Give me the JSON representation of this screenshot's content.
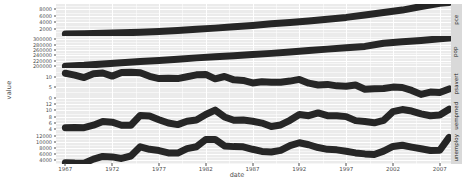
{
  "chart_data": {
    "type": "line",
    "title": "",
    "subtitle": "",
    "xlabel": "date",
    "ylabel": "value",
    "grid": true,
    "legend": "none",
    "facet": {
      "type": "wrap-vertical",
      "strip_position": "right",
      "scales": "free_y",
      "labels": [
        "pce",
        "pop",
        "psavert",
        "uempmed",
        "unemploy"
      ]
    },
    "x": {
      "label": "date",
      "ticks": [
        "1967",
        "1972",
        "1977",
        "1982",
        "1987",
        "1992",
        "1997",
        "2002",
        "2007"
      ],
      "values": [
        1967,
        1972,
        1977,
        1982,
        1987,
        1992,
        1997,
        2002,
        2007
      ],
      "range": [
        1966.0,
        2008.2
      ],
      "minor_ticks": [
        1969.5,
        1974.5,
        1979.5,
        1984.5,
        1989.5,
        1994.5,
        1999.5,
        2004.5
      ]
    },
    "panels": [
      {
        "name": "pce",
        "strip_label": "pce",
        "ylabel_ticks": [
          "8000",
          "6000",
          "4000",
          "2000"
        ],
        "ytick_values": [
          8000,
          6000,
          4000,
          2000
        ],
        "ylim": [
          -100,
          9600
        ],
        "series": {
          "name": "pce",
          "x": [
            1967,
            1969,
            1971,
            1973,
            1975,
            1977,
            1979,
            1981,
            1983,
            1985,
            1987,
            1989,
            1991,
            1993,
            1995,
            1997,
            1999,
            2001,
            2003,
            2005,
            2007,
            2008
          ],
          "y": [
            507,
            603,
            703,
            859,
            1035,
            1278,
            1588,
            1937,
            2286,
            2705,
            3101,
            3596,
            3972,
            4454,
            4976,
            5540,
            6261,
            7047,
            7760,
            8819,
            9827,
            10058
          ]
        }
      },
      {
        "name": "pop",
        "strip_label": "pop",
        "ylabel_ticks": [
          "300000",
          "280000",
          "260000",
          "240000",
          "220000",
          "200000"
        ],
        "ytick_values": [
          300000,
          280000,
          260000,
          240000,
          220000,
          200000
        ],
        "ylim": [
          192000,
          312000
        ],
        "series": {
          "name": "pop",
          "x": [
            1967,
            1969,
            1971,
            1973,
            1975,
            1977,
            1979,
            1981,
            1983,
            1985,
            1987,
            1989,
            1991,
            1993,
            1995,
            1997,
            1999,
            2001,
            2003,
            2005,
            2007,
            2008
          ],
          "y": [
            198712,
            201898,
            206827,
            211357,
            215973,
            220239,
            225055,
            229966,
            233792,
            237924,
            242289,
            246819,
            252153,
            257783,
            262803,
            267784,
            272958,
            284968,
            290108,
            295516,
            301231,
            304000
          ]
        }
      },
      {
        "name": "psavert",
        "strip_label": "psavert",
        "ylabel_ticks": [
          "10",
          "5",
          "0"
        ],
        "ytick_values": [
          10,
          5,
          0
        ],
        "ylim": [
          -1.2,
          14.2
        ],
        "series": {
          "name": "psavert",
          "x": [
            1967,
            1968,
            1969,
            1970,
            1971,
            1972,
            1973,
            1974,
            1975,
            1976,
            1977,
            1978,
            1979,
            1980,
            1981,
            1982,
            1983,
            1984,
            1985,
            1986,
            1987,
            1988,
            1989,
            1990,
            1991,
            1992,
            1993,
            1994,
            1995,
            1996,
            1997,
            1998,
            1999,
            2000,
            2001,
            2002,
            2003,
            2004,
            2005,
            2006,
            2007,
            2008
          ],
          "y": [
            11.7,
            10.8,
            9.6,
            11.4,
            11.8,
            10.3,
            12.0,
            12.2,
            11.9,
            10.2,
            9.1,
            9.3,
            9.1,
            10.0,
            10.9,
            11.1,
            9.0,
            10.1,
            8.5,
            8.2,
            7.0,
            7.6,
            7.4,
            7.3,
            7.9,
            8.7,
            6.9,
            6.0,
            6.3,
            5.6,
            5.4,
            6.0,
            4.0,
            4.2,
            4.3,
            5.0,
            4.8,
            3.4,
            1.5,
            2.6,
            2.4,
            4.1
          ]
        }
      },
      {
        "name": "uempmed",
        "strip_label": "uempmed",
        "ylabel_ticks": [
          "12",
          "10",
          "8",
          "6",
          "4"
        ],
        "ytick_values": [
          12,
          10,
          8,
          6,
          4
        ],
        "ylim": [
          3.0,
          13.4
        ],
        "series": {
          "name": "uempmed",
          "x": [
            1967,
            1968,
            1969,
            1970,
            1971,
            1972,
            1973,
            1974,
            1975,
            1976,
            1977,
            1978,
            1979,
            1980,
            1981,
            1982,
            1983,
            1984,
            1985,
            1986,
            1987,
            1988,
            1989,
            1990,
            1991,
            1992,
            1993,
            1994,
            1995,
            1996,
            1997,
            1998,
            1999,
            2000,
            2001,
            2002,
            2003,
            2004,
            2005,
            2006,
            2007,
            2008
          ],
          "y": [
            4.4,
            4.5,
            4.4,
            5.2,
            6.4,
            6.2,
            5.2,
            5.2,
            8.4,
            8.2,
            7.0,
            5.9,
            5.4,
            6.5,
            6.9,
            8.7,
            10.1,
            7.9,
            6.8,
            6.9,
            6.5,
            5.9,
            4.8,
            5.3,
            6.8,
            8.7,
            8.3,
            9.2,
            8.3,
            8.3,
            8.0,
            6.7,
            6.4,
            6.0,
            6.8,
            9.6,
            10.3,
            9.8,
            8.9,
            8.3,
            8.5,
            10.4
          ]
        }
      },
      {
        "name": "unemploy",
        "strip_label": "unemploy",
        "ylabel_ticks": [
          "12000",
          "10000",
          "8000",
          "6000",
          "4000"
        ],
        "ytick_values": [
          12000,
          10000,
          8000,
          6000,
          4000
        ],
        "ylim": [
          2500,
          13200
        ],
        "series": {
          "name": "unemploy",
          "x": [
            1967,
            1968,
            1969,
            1970,
            1971,
            1972,
            1973,
            1974,
            1975,
            1976,
            1977,
            1978,
            1979,
            1980,
            1981,
            1982,
            1983,
            1984,
            1985,
            1986,
            1987,
            1988,
            1989,
            1990,
            1991,
            1992,
            1993,
            1994,
            1995,
            1996,
            1997,
            1998,
            1999,
            2000,
            2001,
            2002,
            2003,
            2004,
            2005,
            2006,
            2007,
            2008
          ],
          "y": [
            2944,
            2811,
            2785,
            4127,
            5022,
            4875,
            4359,
            5173,
            8266,
            7406,
            6991,
            6202,
            6137,
            7637,
            8273,
            10678,
            10717,
            8539,
            8312,
            8237,
            7425,
            6701,
            6528,
            7047,
            8628,
            9613,
            8940,
            7996,
            7404,
            7236,
            6739,
            6210,
            5880,
            5692,
            6801,
            8378,
            8774,
            8149,
            7591,
            7001,
            7078,
            11400
          ]
        }
      }
    ]
  }
}
